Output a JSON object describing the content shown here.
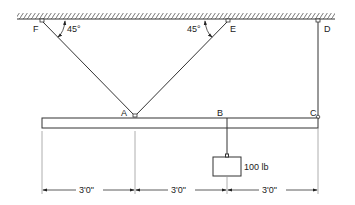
{
  "diagram": {
    "labels": {
      "F": "F",
      "E": "E",
      "D": "D",
      "A": "A",
      "B": "B",
      "C": "C"
    },
    "angles": {
      "left": "45°",
      "right": "45°"
    },
    "load": "100 lb",
    "dimensions": [
      "3'0\"",
      "3'0\"",
      "3'0\""
    ],
    "colors": {
      "line": "#333333",
      "background": "#ffffff"
    }
  }
}
